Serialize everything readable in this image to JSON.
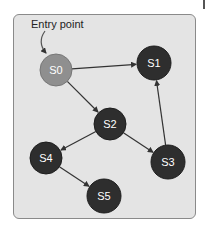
{
  "diagram": {
    "annotation": "Entry point",
    "colors": {
      "background": "#e4e4e4",
      "border": "#8a8a8a",
      "entry_node": "#8f8f8f",
      "node": "#2e2e2e",
      "edge": "#333333",
      "label": "#ffffff"
    },
    "nodes": [
      {
        "id": "S0",
        "label": "S0",
        "x": 56,
        "y": 70,
        "r": 16,
        "entry": true
      },
      {
        "id": "S1",
        "label": "S1",
        "x": 154,
        "y": 63,
        "r": 17
      },
      {
        "id": "S2",
        "label": "S2",
        "x": 110,
        "y": 124,
        "r": 16
      },
      {
        "id": "S3",
        "label": "S3",
        "x": 168,
        "y": 162,
        "r": 17
      },
      {
        "id": "S4",
        "label": "S4",
        "x": 46,
        "y": 158,
        "r": 16
      },
      {
        "id": "S5",
        "label": "S5",
        "x": 104,
        "y": 196,
        "r": 17
      }
    ],
    "edges": [
      {
        "from": "S0",
        "to": "S1"
      },
      {
        "from": "S0",
        "to": "S2"
      },
      {
        "from": "S2",
        "to": "S4"
      },
      {
        "from": "S2",
        "to": "S3"
      },
      {
        "from": "S3",
        "to": "S1"
      },
      {
        "from": "S4",
        "to": "S5"
      }
    ]
  }
}
